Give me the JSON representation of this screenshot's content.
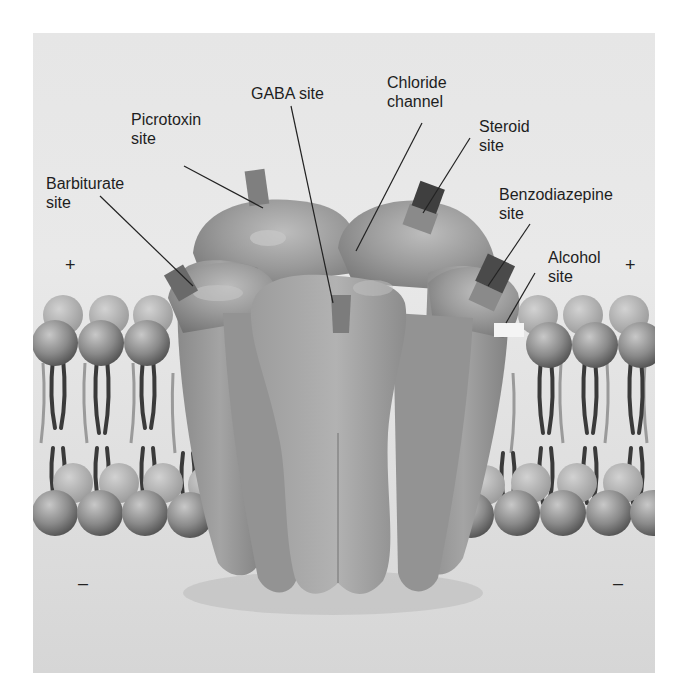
{
  "figure": {
    "labels": {
      "picrotoxin": "Picrotoxin\nsite",
      "gaba": "GABA site",
      "chloride": "Chloride\nchannel",
      "steroid": "Steroid\nsite",
      "barbiturate": "Barbiturate\nsite",
      "benzodiazepine": "Benzodiazepine\nsite",
      "alcohol": "Alcohol\nsite"
    },
    "charges": {
      "outside_left": "+",
      "outside_right": "+",
      "inside_left": "–",
      "inside_right": "–"
    },
    "colors": {
      "background_top": "#ececec",
      "background_bottom": "#d9d9d9",
      "receptor": "#8e8e8e",
      "receptor_highlight": "#b4b4b4",
      "site_light": "#7d7d7d",
      "site_dark": "#3f3f3f",
      "alcohol_site": "#f4f4f4",
      "lipid_head": "#8a8a8a",
      "lipid_tail": "#3a3a3a",
      "leader_line": "#222222"
    }
  }
}
